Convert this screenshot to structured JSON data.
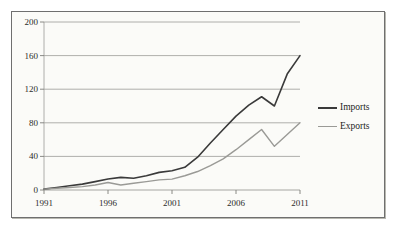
{
  "chart_data": {
    "type": "line",
    "title": "",
    "subtitle": "",
    "xlabel": "",
    "ylabel": "",
    "xlim": [
      1991,
      2011
    ],
    "ylim": [
      0,
      200
    ],
    "grid": true,
    "grid_axis": "y",
    "legend_position": "right",
    "x": [
      1991,
      1992,
      1993,
      1994,
      1995,
      1996,
      1997,
      1998,
      1999,
      2000,
      2001,
      2002,
      2003,
      2004,
      2005,
      2006,
      2007,
      2008,
      2009,
      2010,
      2011
    ],
    "xticks": [
      1991,
      1996,
      2001,
      2006,
      2011
    ],
    "xticklabels": [
      "1991",
      "1996",
      "2001",
      "2006",
      "2011"
    ],
    "yticks": [
      0,
      40,
      80,
      120,
      160,
      200
    ],
    "yticklabels": [
      "0",
      "40",
      "80",
      "120",
      "160",
      "200"
    ],
    "series": [
      {
        "name": "Imports",
        "color": "#3a3a3a",
        "linewidth": 1.6,
        "values": [
          1,
          3,
          5,
          7,
          10,
          13,
          15,
          14,
          17,
          21,
          23,
          27,
          39,
          56,
          72,
          88,
          101,
          111,
          100,
          138,
          160
        ]
      },
      {
        "name": "Exports",
        "color": "#9a9a96",
        "linewidth": 1.4,
        "values": [
          1,
          2,
          3,
          4,
          6,
          9,
          6,
          8,
          10,
          12,
          13,
          17,
          22,
          29,
          37,
          48,
          60,
          72,
          52,
          66,
          80
        ]
      }
    ]
  },
  "legend": {
    "items": [
      {
        "label": "Imports",
        "color": "#3a3a3a"
      },
      {
        "label": "Exports",
        "color": "#9a9a96"
      }
    ]
  },
  "axes": {
    "y_tick_labels": [
      "200",
      "160",
      "120",
      "80",
      "40",
      "0"
    ],
    "x_tick_labels": [
      "1991",
      "1996",
      "2001",
      "2006",
      "2011"
    ]
  }
}
